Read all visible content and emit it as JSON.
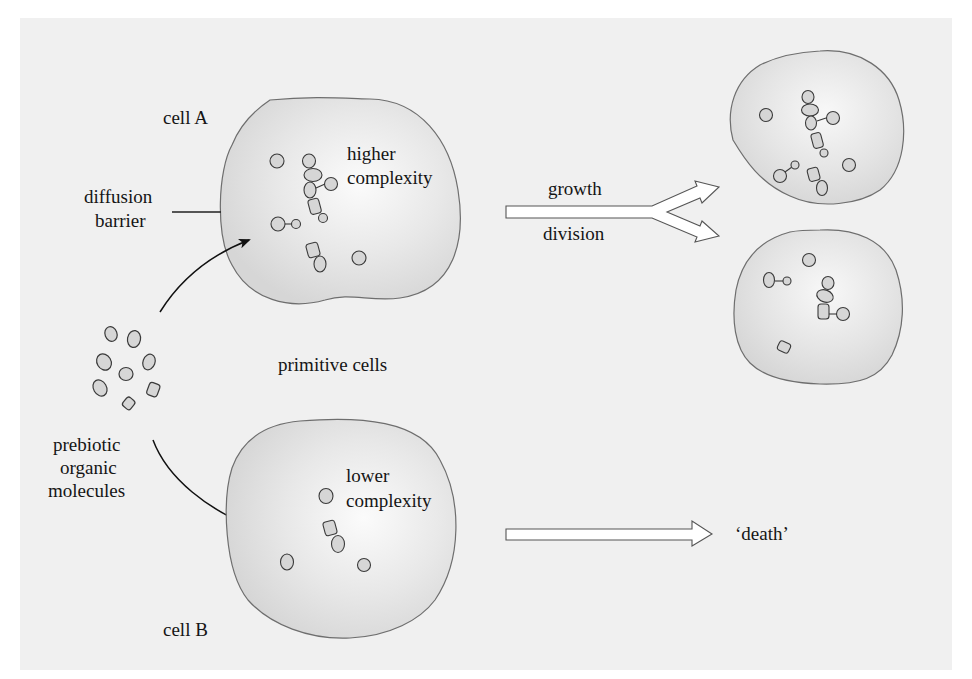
{
  "colors": {
    "page_background": "#ffffff",
    "panel_background": "#f0f0f0",
    "cell_fill_center": "#fbfbfb",
    "cell_fill_edge": "#d9d9d9",
    "cell_outline": "#6e6e6e",
    "molecule_fill": "#d6d6d6",
    "molecule_outline": "#3a3a3a",
    "arrow_fill": "#ffffff",
    "arrow_outline": "#555555",
    "text": "#151515"
  },
  "labels": {
    "cell_a": "cell A",
    "cell_b": "cell B",
    "diffusion_barrier_line1": "diffusion",
    "diffusion_barrier_line2": "barrier",
    "higher_complexity_line1": "higher",
    "higher_complexity_line2": "complexity",
    "lower_complexity_line1": "lower",
    "lower_complexity_line2": "complexity",
    "primitive_cells": "primitive cells",
    "prebiotic_line1": "prebiotic",
    "prebiotic_line2": "organic",
    "prebiotic_line3": "molecules",
    "growth": "growth",
    "division": "division",
    "death": "‘death’"
  },
  "nodes": [
    {
      "id": "prebiotic-molecules",
      "label": "prebiotic organic molecules",
      "count": 9
    },
    {
      "id": "cell-a",
      "label": "cell A",
      "description": "higher complexity"
    },
    {
      "id": "cell-b",
      "label": "cell B",
      "description": "lower complexity"
    },
    {
      "id": "daughter-cell-1",
      "label": ""
    },
    {
      "id": "daughter-cell-2",
      "label": ""
    },
    {
      "id": "death",
      "label": "‘death’"
    }
  ],
  "edges": [
    {
      "from": "prebiotic-molecules",
      "to": "cell-a",
      "type": "curved-arrow"
    },
    {
      "from": "prebiotic-molecules",
      "to": "cell-b",
      "type": "curved-arrow"
    },
    {
      "from": "cell-a",
      "to": [
        "daughter-cell-1",
        "daughter-cell-2"
      ],
      "type": "split-block-arrow",
      "label": "growth / division"
    },
    {
      "from": "cell-b",
      "to": "death",
      "type": "block-arrow"
    }
  ]
}
